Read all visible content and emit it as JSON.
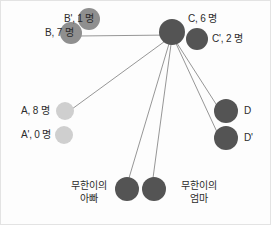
{
  "diagram": {
    "type": "node-link-graph",
    "background": "#fdfdfd",
    "border_color": "#e3e3e3",
    "colors": {
      "dark_node": "#545454",
      "mid_node": "#8f8f8f",
      "light_node": "#cfcfcf",
      "edge": "#8a8a8a",
      "text": "#2b2b2b"
    },
    "hub": {
      "name": "C",
      "x": 171,
      "y": 31,
      "r": 13
    },
    "nodes": [
      {
        "id": "C",
        "x": 171,
        "y": 31,
        "r": 13,
        "shade": "dark_node"
      },
      {
        "id": "Cprime",
        "x": 196,
        "y": 38,
        "r": 11,
        "shade": "dark_node"
      },
      {
        "id": "Bprime",
        "x": 88,
        "y": 18,
        "r": 11,
        "shade": "mid_node"
      },
      {
        "id": "B",
        "x": 70,
        "y": 32,
        "r": 11,
        "shade": "mid_node"
      },
      {
        "id": "A",
        "x": 64,
        "y": 110,
        "r": 9,
        "shade": "light_node"
      },
      {
        "id": "Aprime",
        "x": 63,
        "y": 134,
        "r": 9,
        "shade": "light_node"
      },
      {
        "id": "D",
        "x": 225,
        "y": 110,
        "r": 12,
        "shade": "dark_node"
      },
      {
        "id": "Dprime",
        "x": 225,
        "y": 137,
        "r": 12,
        "shade": "dark_node"
      },
      {
        "id": "father",
        "x": 126,
        "y": 188,
        "r": 12,
        "shade": "dark_node"
      },
      {
        "id": "mother",
        "x": 153,
        "y": 188,
        "r": 12,
        "shade": "dark_node"
      }
    ],
    "edges": [
      {
        "from": "C",
        "to": "B",
        "x1": 171,
        "y1": 34,
        "x2": 77,
        "y2": 35
      },
      {
        "from": "C",
        "to": "A",
        "x1": 171,
        "y1": 35,
        "x2": 71,
        "y2": 108
      },
      {
        "from": "C",
        "to": "father",
        "x1": 170,
        "y1": 36,
        "x2": 128,
        "y2": 177
      },
      {
        "from": "C",
        "to": "mother",
        "x1": 171,
        "y1": 36,
        "x2": 152,
        "y2": 177
      },
      {
        "from": "C",
        "to": "D",
        "x1": 172,
        "y1": 36,
        "x2": 215,
        "y2": 103
      },
      {
        "from": "C",
        "to": "Dprime",
        "x1": 172,
        "y1": 36,
        "x2": 216,
        "y2": 131
      }
    ],
    "labels": [
      {
        "id": "label-c",
        "text": "C, 6 명",
        "x": 187,
        "y": 12,
        "align": "left"
      },
      {
        "id": "label-c-prime",
        "text": "C', 2 명",
        "x": 211,
        "y": 32,
        "align": "left"
      },
      {
        "id": "label-b-prime",
        "text": "B', 1 명",
        "x": 63,
        "y": 12,
        "align": "left"
      },
      {
        "id": "label-b",
        "text": "B, 7 명",
        "x": 44,
        "y": 26,
        "align": "left"
      },
      {
        "id": "label-a",
        "text": "A, 8 명",
        "x": 20,
        "y": 104,
        "align": "left"
      },
      {
        "id": "label-a-prime",
        "text": "A', 0 명",
        "x": 20,
        "y": 128,
        "align": "left"
      },
      {
        "id": "label-d",
        "text": "D",
        "x": 243,
        "y": 104,
        "align": "left"
      },
      {
        "id": "label-d-prime",
        "text": "D'",
        "x": 243,
        "y": 131,
        "align": "left"
      },
      {
        "id": "label-father",
        "text": "무한이의\n아빠",
        "x": 58,
        "y": 178,
        "align": "center",
        "width": 60
      },
      {
        "id": "label-mother",
        "text": "무한이의\n엄마",
        "x": 168,
        "y": 178,
        "align": "center",
        "width": 60
      }
    ]
  }
}
